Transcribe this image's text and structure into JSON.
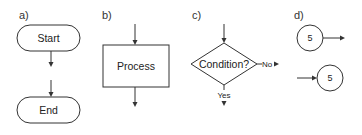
{
  "panels": {
    "a": {
      "label": "a)",
      "start": "Start",
      "end": "End"
    },
    "b": {
      "label": "b)",
      "process": "Process"
    },
    "c": {
      "label": "c)",
      "condition": "Condition?",
      "no": "No",
      "yes": "Yes"
    },
    "d": {
      "label": "d)",
      "connector_out": "5",
      "connector_in": "5"
    }
  },
  "colors": {
    "stroke": "#333333",
    "background": "#ffffff"
  }
}
